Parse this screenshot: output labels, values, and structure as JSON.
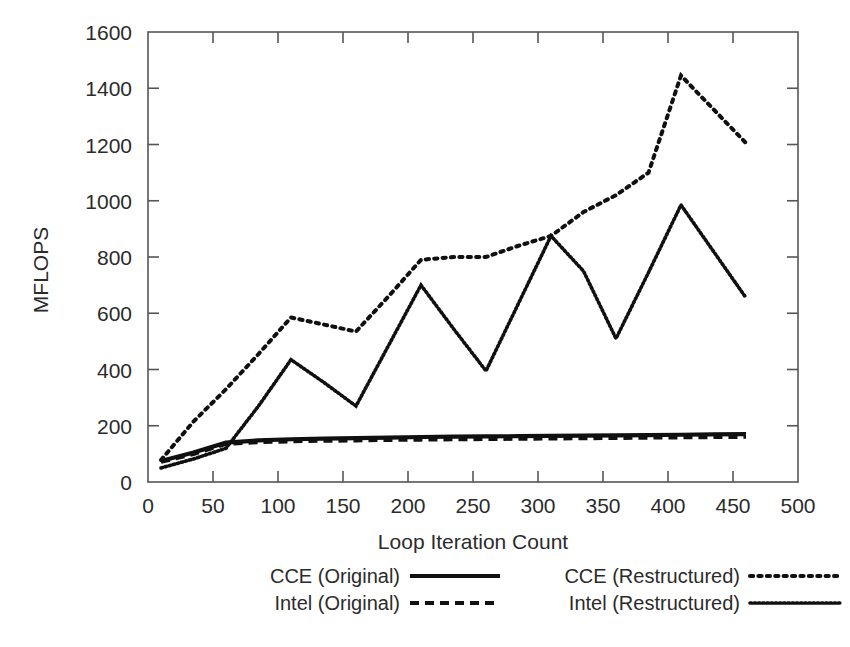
{
  "chart_data": {
    "type": "line",
    "title": "",
    "xlabel": "Loop Iteration Count",
    "ylabel": "MFLOPS",
    "xlim": [
      0,
      500
    ],
    "ylim": [
      0,
      1600
    ],
    "xticks": [
      0,
      50,
      100,
      150,
      200,
      250,
      300,
      350,
      400,
      450,
      500
    ],
    "yticks": [
      0,
      200,
      400,
      600,
      800,
      1000,
      1200,
      1400,
      1600
    ],
    "grid": false,
    "legend_position": "below-plot",
    "x": [
      10,
      35,
      60,
      85,
      110,
      135,
      160,
      185,
      210,
      235,
      260,
      285,
      310,
      335,
      360,
      385,
      410,
      435,
      460
    ],
    "series": [
      {
        "name": "CCE (Original)",
        "style": "solid",
        "values": [
          75,
          105,
          140,
          148,
          152,
          154,
          156,
          158,
          160,
          161,
          162,
          163,
          164,
          165,
          166,
          167,
          168,
          169,
          170
        ]
      },
      {
        "name": "Intel (Original)",
        "style": "dashed",
        "values": [
          72,
          100,
          136,
          142,
          145,
          147,
          148,
          150,
          151,
          152,
          153,
          154,
          155,
          156,
          157,
          158,
          159,
          160,
          161
        ]
      },
      {
        "name": "CCE (Restructured)",
        "style": "dotted-coarse",
        "values": [
          78,
          215,
          330,
          455,
          585,
          560,
          535,
          660,
          790,
          800,
          800,
          840,
          875,
          960,
          1020,
          1100,
          1445,
          1325,
          1205
        ]
      },
      {
        "name": "Intel (Restructured)",
        "style": "dotted-fine",
        "values": [
          50,
          82,
          120,
          270,
          435,
          355,
          270,
          485,
          700,
          545,
          395,
          635,
          875,
          750,
          510,
          745,
          985,
          820,
          655
        ]
      }
    ]
  },
  "axes": {
    "y_tick_labels": [
      "1600",
      "1400",
      "1200",
      "1000",
      "800",
      "600",
      "400",
      "200",
      "0"
    ],
    "x_tick_labels": [
      "0",
      "50",
      "100",
      "150",
      "200",
      "250",
      "300",
      "350",
      "400",
      "450",
      "500"
    ],
    "x_axis_title": "Loop Iteration Count",
    "y_axis_title": "MFLOPS"
  },
  "legend": {
    "entries": [
      {
        "label": "CCE (Original)",
        "style": "solid"
      },
      {
        "label": "Intel (Original)",
        "style": "dashed"
      },
      {
        "label": "CCE (Restructured)",
        "style": "dotted-coarse"
      },
      {
        "label": "Intel (Restructured)",
        "style": "dotted-fine"
      }
    ]
  },
  "colors": {
    "ink": "#101010",
    "axis": "#555555",
    "background": "#ffffff"
  }
}
